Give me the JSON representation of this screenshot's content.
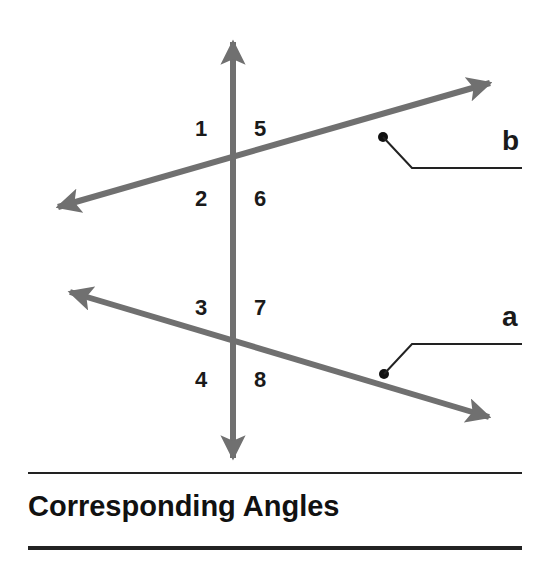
{
  "diagram": {
    "title": "Corresponding Angles",
    "line_color": "#707070",
    "text_color": "#1a1a1a",
    "angle_labels": [
      {
        "label": "1",
        "x": 203,
        "y": 135
      },
      {
        "label": "5",
        "x": 262,
        "y": 135
      },
      {
        "label": "2",
        "x": 203,
        "y": 206
      },
      {
        "label": "6",
        "x": 262,
        "y": 206
      },
      {
        "label": "3",
        "x": 203,
        "y": 315
      },
      {
        "label": "7",
        "x": 262,
        "y": 315
      },
      {
        "label": "4",
        "x": 203,
        "y": 388
      },
      {
        "label": "8",
        "x": 262,
        "y": 388
      }
    ],
    "line_labels": {
      "b": "b",
      "a": "a"
    }
  }
}
